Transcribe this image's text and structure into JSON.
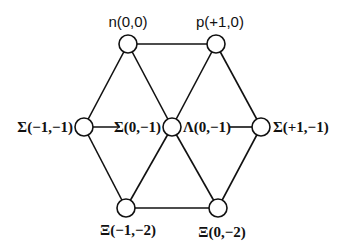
{
  "diagram": {
    "nodes": [
      {
        "id": "n",
        "label": "n(0,0)",
        "x": 128,
        "y": 44
      },
      {
        "id": "p",
        "label": "p(+1,0)",
        "x": 216,
        "y": 44
      },
      {
        "id": "sigma_minus",
        "label": "Σ(−1,−1)",
        "x": 84,
        "y": 127
      },
      {
        "id": "center",
        "label_left": "Σ(0,−1)",
        "label_right": "Λ(0,−1)",
        "x": 172,
        "y": 127
      },
      {
        "id": "sigma_plus",
        "label": "Σ(+1,−1)",
        "x": 261,
        "y": 127
      },
      {
        "id": "xi_minus",
        "label": "Ξ(−1,−2)",
        "x": 126,
        "y": 208
      },
      {
        "id": "xi_zero",
        "label": "Ξ(0,−2)",
        "x": 218,
        "y": 208
      }
    ],
    "edges": [
      [
        "n",
        "p"
      ],
      [
        "n",
        "sigma_minus"
      ],
      [
        "n",
        "center"
      ],
      [
        "p",
        "center"
      ],
      [
        "p",
        "sigma_plus"
      ],
      [
        "sigma_minus",
        "center"
      ],
      [
        "center",
        "sigma_plus"
      ],
      [
        "sigma_minus",
        "xi_minus"
      ],
      [
        "center",
        "xi_minus"
      ],
      [
        "center",
        "xi_zero"
      ],
      [
        "sigma_plus",
        "xi_zero"
      ],
      [
        "xi_minus",
        "xi_zero"
      ]
    ]
  },
  "labels": {
    "n": "n(0,0)",
    "p": "p(+1,0)",
    "sigma_minus": "Σ(−1,−1)",
    "sigma_zero": "Σ(0,−1)",
    "lambda": "Λ(0,−1)",
    "sigma_plus": "Σ(+1,−1)",
    "xi_minus": "Ξ(−1,−2)",
    "xi_zero": "Ξ(0,−2)"
  }
}
